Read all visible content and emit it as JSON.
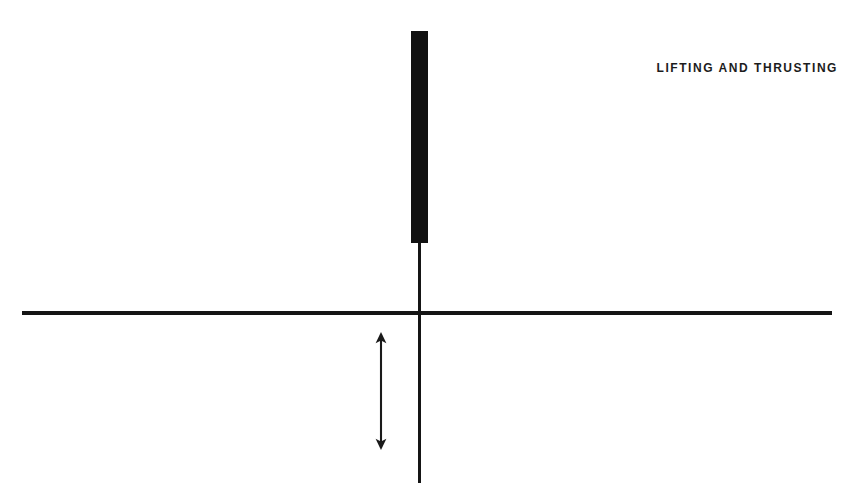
{
  "figure": {
    "title": "LIFTING AND THRUSTING",
    "clipped_caption": "g g",
    "background_color": "#ffffff",
    "ink_color": "#151515"
  },
  "diagram": {
    "vertical_axis": {
      "thick_segment_label": "thick-vertical-bar",
      "thin_segment_label": "thin-vertical-line"
    },
    "horizontal_axis": {
      "label": "horizontal-baseline"
    },
    "measurement_arrow": {
      "label": "double-headed-arrow",
      "direction": "vertical"
    }
  }
}
